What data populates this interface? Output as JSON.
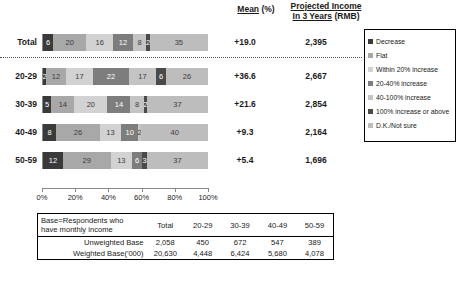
{
  "headers": {
    "mean": "Mean",
    "mean_unit": "(%)",
    "income_line1": "Projected Income",
    "income_line2": "In 3 Years",
    "income_unit": "(RMB)"
  },
  "axis": {
    "ticks": [
      "0%",
      "20%",
      "40%",
      "60%",
      "80%",
      "100%"
    ]
  },
  "legend": {
    "items": [
      {
        "label": "Decrease",
        "color": "#3a3a3a"
      },
      {
        "label": "Flat",
        "color": "#a8a8a8"
      },
      {
        "label": "Within 20% increase",
        "color": "#d2d2d2"
      },
      {
        "label": "20-40% increase",
        "color": "#7d7d7d"
      },
      {
        "label": "40-100% increase",
        "color": "#c4c4c4"
      },
      {
        "label": "100% increase or above",
        "color": "#4a4a4a"
      },
      {
        "label": "D.K./Not sure",
        "color": "#bdbdbd"
      }
    ]
  },
  "chart_data": {
    "type": "bar",
    "orientation": "horizontal",
    "stacked": true,
    "stacked_percent": true,
    "title": "",
    "xlabel": "",
    "ylabel": "",
    "xlim": [
      0,
      100
    ],
    "grid": false,
    "legend_position": "right",
    "categories": [
      "Total",
      "20-29",
      "30-39",
      "40-49",
      "50-59"
    ],
    "series": [
      {
        "name": "Decrease",
        "color": "#3a3a3a",
        "values": [
          6,
          2,
          5,
          8,
          12
        ]
      },
      {
        "name": "Flat",
        "color": "#a8a8a8",
        "values": [
          20,
          12,
          14,
          26,
          29
        ]
      },
      {
        "name": "Within 20% increase",
        "color": "#d2d2d2",
        "values": [
          16,
          17,
          20,
          13,
          13
        ]
      },
      {
        "name": "20-40% increase",
        "color": "#7d7d7d",
        "values": [
          12,
          22,
          14,
          10,
          6
        ]
      },
      {
        "name": "40-100% increase",
        "color": "#c4c4c4",
        "values": [
          8,
          17,
          8,
          2,
          0
        ]
      },
      {
        "name": "100% increase or above",
        "color": "#4a4a4a",
        "values": [
          2,
          6,
          2,
          0,
          3
        ]
      },
      {
        "name": "D.K./Not sure",
        "color": "#bdbdbd",
        "values": [
          35,
          26,
          37,
          40,
          37
        ]
      }
    ],
    "annotations": {
      "mean_percent": [
        "+19.0",
        "+36.6",
        "+21.6",
        "+9.3",
        "+5.4"
      ],
      "projected_income_rmb": [
        "2,395",
        "2,667",
        "2,854",
        "2,164",
        "1,696"
      ]
    }
  },
  "base_table": {
    "caption_line1": "Base=Respondents who",
    "caption_line2": "have monthly income",
    "columns": [
      "Total",
      "20-29",
      "30-39",
      "40-49",
      "50-59"
    ],
    "rows": [
      {
        "label": "Unweighted Base",
        "values": [
          "2,058",
          "450",
          "672",
          "547",
          "389"
        ]
      },
      {
        "label": "Weighted Base('000)",
        "values": [
          "20,630",
          "4,448",
          "6,424",
          "5,680",
          "4,078"
        ]
      }
    ]
  }
}
